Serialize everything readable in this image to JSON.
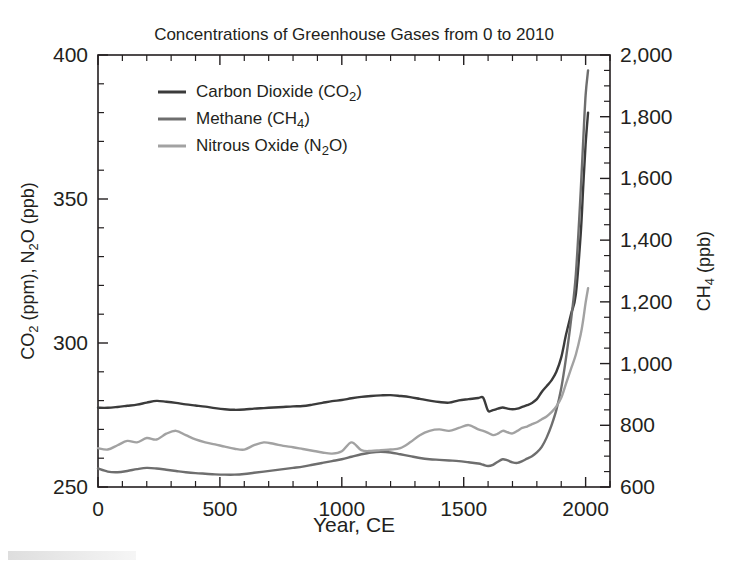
{
  "chart_data": {
    "type": "line",
    "title": "Concentrations of Greenhouse Gases from 0 to 2010",
    "xlabel": "Year, CE",
    "ylabel_left": "CO2 (ppm), N2O (ppb)",
    "ylabel_right": "CH4 (ppb)",
    "ylabel_left_parts": {
      "a": "CO",
      "a_sub": "2",
      "b": " (ppm), N",
      "b_sub": "2",
      "c": "O (ppb)"
    },
    "ylabel_right_parts": {
      "a": "CH",
      "a_sub": "4",
      "b": " (ppb)"
    },
    "xlim": [
      0,
      2100
    ],
    "ylim_left": [
      250,
      400
    ],
    "ylim_right": [
      600,
      2000
    ],
    "xticks": [
      0,
      500,
      1000,
      1500,
      2000
    ],
    "xtick_labels": [
      "0",
      "500",
      "1000",
      "1500",
      "2000"
    ],
    "xminor_step": 100,
    "yticks_left": [
      250,
      300,
      350,
      400
    ],
    "ytick_labels_left": [
      "250",
      "300",
      "350",
      "400"
    ],
    "yminor_step_left": 10,
    "yticks_right": [
      600,
      800,
      1000,
      1200,
      1400,
      1600,
      1800,
      2000
    ],
    "ytick_labels_right": [
      "600",
      "800",
      "1,000",
      "1,200",
      "1,400",
      "1,600",
      "1,800",
      "2,000"
    ],
    "yminor_step_right": 50,
    "grid": false,
    "legend_position": "top-left-inside",
    "legend": [
      {
        "label": "Carbon Dioxide (CO2)",
        "text_a": "Carbon Dioxide (CO",
        "sub": "2",
        "text_b": ")",
        "color": "#3b3b3b",
        "series": "co2"
      },
      {
        "label": "Methane (CH4)",
        "text_a": "Methane (CH",
        "sub": "4",
        "text_b": ")",
        "color": "#6e6e6e",
        "series": "ch4"
      },
      {
        "label": "Nitrous Oxide (N2O)",
        "text_a": "Nitrous Oxide (N",
        "sub": "2",
        "text_b": "O)",
        "color": "#a2a2a2",
        "series": "n2o"
      }
    ],
    "series": [
      {
        "name": "Carbon Dioxide (CO2)",
        "axis": "left",
        "units": "ppm",
        "color": "#3b3b3b",
        "x": [
          0,
          40,
          80,
          120,
          160,
          200,
          240,
          280,
          320,
          360,
          400,
          440,
          480,
          520,
          560,
          600,
          640,
          680,
          720,
          760,
          800,
          840,
          880,
          920,
          960,
          1000,
          1040,
          1080,
          1120,
          1160,
          1200,
          1240,
          1280,
          1320,
          1360,
          1400,
          1440,
          1480,
          1520,
          1560,
          1580,
          1600,
          1620,
          1640,
          1660,
          1680,
          1700,
          1720,
          1740,
          1760,
          1780,
          1800,
          1820,
          1840,
          1860,
          1880,
          1900,
          1920,
          1940,
          1960,
          1980,
          1990,
          2000,
          2010
        ],
        "y": [
          277.5,
          277.5,
          277.8,
          278.2,
          278.6,
          279.3,
          279.9,
          279.6,
          279.2,
          278.7,
          278.3,
          277.9,
          277.4,
          277.0,
          276.8,
          276.9,
          277.2,
          277.4,
          277.6,
          277.8,
          278.0,
          278.1,
          278.6,
          279.2,
          279.8,
          280.2,
          280.8,
          281.3,
          281.6,
          281.8,
          281.9,
          281.6,
          281.2,
          280.6,
          280.0,
          279.5,
          279.3,
          280.1,
          280.5,
          280.9,
          281.0,
          276.5,
          276.7,
          277.2,
          277.6,
          277.2,
          277.0,
          277.2,
          277.8,
          278.4,
          279.2,
          280.5,
          283.0,
          285.0,
          287.0,
          290.0,
          295.0,
          303.0,
          310.0,
          317.0,
          338.0,
          354.0,
          369.0,
          380.0
        ]
      },
      {
        "name": "Methane (CH4)",
        "axis": "right",
        "units": "ppb",
        "color": "#6e6e6e",
        "x": [
          0,
          40,
          80,
          120,
          160,
          200,
          240,
          280,
          320,
          360,
          400,
          440,
          480,
          520,
          560,
          600,
          640,
          680,
          720,
          760,
          800,
          840,
          880,
          920,
          960,
          1000,
          1040,
          1080,
          1120,
          1160,
          1200,
          1240,
          1280,
          1320,
          1360,
          1400,
          1440,
          1480,
          1520,
          1560,
          1580,
          1600,
          1620,
          1640,
          1660,
          1680,
          1700,
          1720,
          1740,
          1760,
          1780,
          1800,
          1820,
          1840,
          1860,
          1880,
          1900,
          1920,
          1940,
          1960,
          1980,
          1990,
          2000,
          2010
        ],
        "y": [
          660,
          650,
          648,
          652,
          658,
          662,
          660,
          656,
          652,
          648,
          645,
          643,
          641,
          640,
          640,
          642,
          646,
          650,
          654,
          658,
          662,
          666,
          672,
          678,
          684,
          690,
          698,
          706,
          712,
          714,
          712,
          706,
          700,
          694,
          690,
          688,
          686,
          684,
          680,
          676,
          672,
          668,
          672,
          682,
          690,
          686,
          680,
          678,
          684,
          692,
          700,
          712,
          730,
          760,
          800,
          850,
          920,
          1020,
          1140,
          1290,
          1560,
          1720,
          1870,
          1950
        ]
      },
      {
        "name": "Nitrous Oxide (N2O)",
        "axis": "left",
        "units": "ppb",
        "color": "#a2a2a2",
        "x": [
          0,
          40,
          80,
          120,
          160,
          200,
          240,
          280,
          320,
          360,
          400,
          440,
          480,
          520,
          560,
          600,
          640,
          680,
          720,
          760,
          800,
          840,
          880,
          920,
          960,
          1000,
          1040,
          1080,
          1120,
          1160,
          1200,
          1240,
          1280,
          1320,
          1360,
          1400,
          1440,
          1480,
          1520,
          1560,
          1580,
          1600,
          1620,
          1640,
          1660,
          1680,
          1700,
          1720,
          1740,
          1760,
          1780,
          1800,
          1820,
          1840,
          1860,
          1880,
          1900,
          1920,
          1940,
          1960,
          1980,
          1990,
          2000,
          2010
        ],
        "y": [
          263.5,
          263.0,
          264.5,
          266.0,
          265.5,
          267.0,
          266.5,
          268.5,
          269.5,
          268.0,
          266.5,
          265.5,
          264.8,
          264.0,
          263.3,
          263.0,
          264.5,
          265.5,
          265.0,
          264.3,
          263.8,
          263.2,
          262.6,
          262.0,
          261.6,
          262.4,
          265.5,
          262.8,
          262.5,
          262.8,
          263.0,
          263.5,
          265.5,
          268.0,
          269.5,
          270.0,
          269.5,
          270.5,
          271.5,
          270.0,
          269.5,
          268.8,
          268.0,
          268.5,
          269.5,
          269.0,
          268.6,
          269.5,
          270.5,
          271.0,
          271.8,
          272.5,
          273.5,
          274.5,
          276.0,
          278.0,
          281.0,
          286.0,
          291.0,
          296.0,
          303.0,
          308.0,
          314.0,
          319.0
        ]
      }
    ]
  }
}
